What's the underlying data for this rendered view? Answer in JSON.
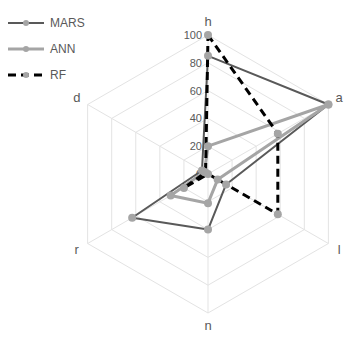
{
  "chart_data": {
    "type": "radar",
    "title": "",
    "categories": [
      "h",
      "a",
      "l",
      "n",
      "r",
      "d"
    ],
    "radial_ticks": [
      0,
      20,
      40,
      60,
      80,
      100
    ],
    "rlim": [
      0,
      100
    ],
    "grid": true,
    "legend_position": "top-left",
    "series": [
      {
        "name": "MARS",
        "values": [
          85,
          100,
          15,
          40,
          63,
          5
        ],
        "color": "#595959",
        "dash": "solid",
        "width": 2
      },
      {
        "name": "ANN",
        "values": [
          20,
          100,
          8,
          21,
          31,
          3
        ],
        "color": "#a5a5a5",
        "dash": "solid",
        "width": 3
      },
      {
        "name": "RF",
        "values": [
          100,
          58,
          58,
          0,
          20,
          2
        ],
        "color": "#000000",
        "dash": "dashed",
        "width": 3
      }
    ],
    "marker_color": "#a5a5a5"
  }
}
